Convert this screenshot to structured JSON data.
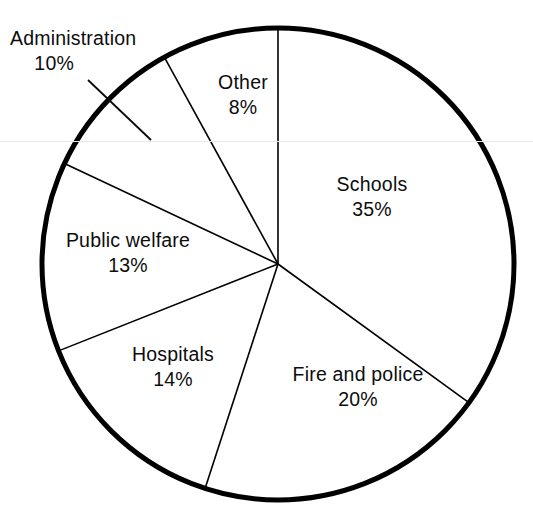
{
  "chart_data": {
    "type": "pie",
    "title": "",
    "subtitle": "",
    "xlabel": "",
    "ylabel": "",
    "legend": "none",
    "grid": false,
    "units": "percent",
    "total": 100,
    "start_angle_deg": 0,
    "direction": "clockwise",
    "categories": [
      "Schools",
      "Fire and police",
      "Hospitals",
      "Public welfare",
      "Administration",
      "Other"
    ],
    "values": [
      35,
      20,
      14,
      13,
      10,
      8
    ],
    "slices": [
      {
        "label": "Schools",
        "value": 35,
        "value_text": "35%",
        "start_deg": 0,
        "end_deg": 126,
        "label_placement": "inside"
      },
      {
        "label": "Fire and police",
        "value": 20,
        "value_text": "20%",
        "start_deg": 126,
        "end_deg": 198,
        "label_placement": "inside"
      },
      {
        "label": "Hospitals",
        "value": 14,
        "value_text": "14%",
        "start_deg": 198,
        "end_deg": 248.4,
        "label_placement": "inside"
      },
      {
        "label": "Public welfare",
        "value": 13,
        "value_text": "13%",
        "start_deg": 248.4,
        "end_deg": 295.2,
        "label_placement": "inside"
      },
      {
        "label": "Administration",
        "value": 10,
        "value_text": "10%",
        "start_deg": 295.2,
        "end_deg": 331.2,
        "label_placement": "outside-leader"
      },
      {
        "label": "Other",
        "value": 8,
        "value_text": "8%",
        "start_deg": 331.2,
        "end_deg": 360,
        "label_placement": "inside"
      }
    ],
    "style": {
      "fill": "#ffffff",
      "outline": "#000000",
      "outline_width_px": 5,
      "divider_color": "#000000",
      "divider_width_px": 1.6,
      "text_color": "#0d0d0d",
      "leader_line_color": "#000000",
      "background": "#ffffff",
      "scan_line_color": "#e9e9e9"
    },
    "geometry": {
      "center_x": 278,
      "center_y": 264,
      "radius": 236
    }
  },
  "labels": {
    "administration": {
      "name": "Administration",
      "value": "10%"
    },
    "other": {
      "name": "Other",
      "value": "8%"
    },
    "schools": {
      "name": "Schools",
      "value": "35%"
    },
    "public_welfare": {
      "name": "Public welfare",
      "value": "13%"
    },
    "hospitals": {
      "name": "Hospitals",
      "value": "14%"
    },
    "fire_police": {
      "name": "Fire and police",
      "value": "20%"
    }
  }
}
